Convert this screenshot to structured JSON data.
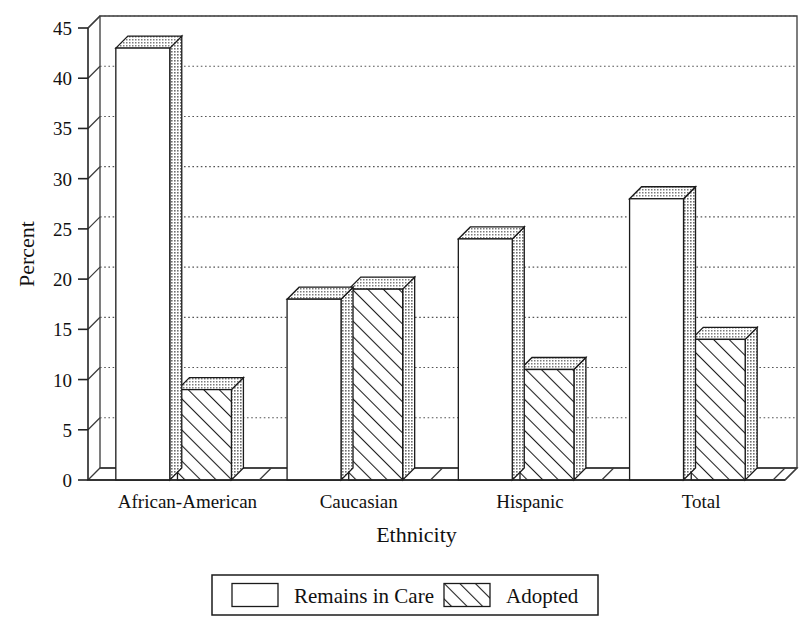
{
  "chart_data": {
    "type": "bar",
    "title": "",
    "xlabel": "Ethnicity",
    "ylabel": "Percent",
    "categories": [
      "African-American",
      "Caucasian",
      "Hispanic",
      "Total"
    ],
    "series": [
      {
        "name": "Remains in Care",
        "values": [
          43,
          18,
          24,
          28
        ],
        "fill": "solid-white"
      },
      {
        "name": "Adopted",
        "values": [
          9,
          19,
          11,
          14
        ],
        "fill": "diagonal-hatch"
      }
    ],
    "ylim": [
      0,
      45
    ],
    "yticks": [
      0,
      5,
      10,
      15,
      20,
      25,
      30,
      35,
      40,
      45
    ],
    "ytick_labels": [
      "0",
      "5",
      "10",
      "15",
      "20",
      "25",
      "30",
      "35",
      "40",
      "45"
    ],
    "grid": true,
    "grid_axis": "y",
    "legend_position": "bottom-center",
    "style": "3d-perspective-bars",
    "colors": {
      "bar_face_remains": "#ffffff",
      "bar_face_adopted": "#ffffff",
      "bar_side_shade": "#b9b9b9",
      "bar_top_shade": "#c9c9c9",
      "outline": "#1b1b1b",
      "gridline": "#555555",
      "axis": "#232323",
      "text": "#111111",
      "background": "#ffffff"
    }
  },
  "axes": {
    "y_title": "Percent",
    "x_title": "Ethnicity"
  },
  "legend": {
    "items": [
      {
        "label": "Remains in Care",
        "swatch": "empty-swatch"
      },
      {
        "label": "Adopted",
        "swatch": "hatched-swatch"
      }
    ]
  }
}
